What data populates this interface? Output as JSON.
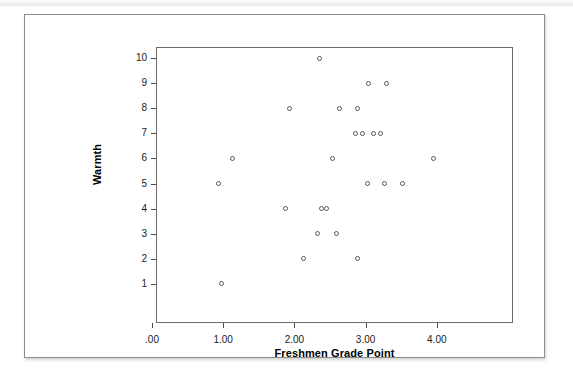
{
  "figure": {
    "type": "scatter-plot",
    "x_axis_title": "Freshmen Grade Point",
    "y_axis_title": "Warmth",
    "x_tick_labels": [
      ".00",
      "1.00",
      "2.00",
      "3.00",
      "4.00"
    ],
    "y_tick_labels": [
      "10",
      "9",
      "8",
      "7",
      "6",
      "5",
      "4",
      "3",
      "2",
      "1"
    ],
    "marker_color": "#58585a",
    "frame_color": "#6b6b6b",
    "card_border_color": "#8c8c8c",
    "background_color": "#ffffff"
  },
  "chart_data": {
    "type": "scatter",
    "title": "",
    "xlabel": "Freshmen Grade Point",
    "ylabel": "Warmth",
    "xlim": [
      -0.2,
      4.3
    ],
    "ylim": [
      0.1,
      11.0
    ],
    "xticks": [
      0,
      1,
      2,
      3,
      4
    ],
    "xtick_labels": [
      ".00",
      "1.00",
      "2.00",
      "3.00",
      "4.00"
    ],
    "yticks": [
      1,
      2,
      3,
      4,
      5,
      6,
      7,
      8,
      9,
      10
    ],
    "ytick_labels": [
      "1",
      "2",
      "3",
      "4",
      "5",
      "6",
      "7",
      "8",
      "9",
      "10"
    ],
    "grid": false,
    "legend": false,
    "marker": "open-circle",
    "n_points": 26,
    "points": [
      {
        "x": 2.35,
        "y": 10
      },
      {
        "x": 3.04,
        "y": 9
      },
      {
        "x": 3.29,
        "y": 9
      },
      {
        "x": 1.93,
        "y": 8
      },
      {
        "x": 2.63,
        "y": 8
      },
      {
        "x": 2.89,
        "y": 8
      },
      {
        "x": 2.86,
        "y": 7
      },
      {
        "x": 2.96,
        "y": 7
      },
      {
        "x": 3.11,
        "y": 7
      },
      {
        "x": 3.21,
        "y": 7
      },
      {
        "x": 1.13,
        "y": 6
      },
      {
        "x": 2.53,
        "y": 6
      },
      {
        "x": 3.95,
        "y": 6
      },
      {
        "x": 0.93,
        "y": 5
      },
      {
        "x": 3.03,
        "y": 5
      },
      {
        "x": 3.27,
        "y": 5
      },
      {
        "x": 3.52,
        "y": 5
      },
      {
        "x": 1.87,
        "y": 4
      },
      {
        "x": 2.38,
        "y": 4
      },
      {
        "x": 2.45,
        "y": 4
      },
      {
        "x": 2.32,
        "y": 3
      },
      {
        "x": 2.59,
        "y": 3
      },
      {
        "x": 2.13,
        "y": 2
      },
      {
        "x": 2.89,
        "y": 2
      },
      {
        "x": 0.97,
        "y": 1
      }
    ]
  }
}
